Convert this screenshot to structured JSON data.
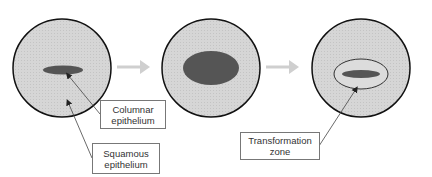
{
  "diagram": {
    "stages": [
      {
        "id": "stage-1",
        "description": "Squamous epithelium surrounding small columnar epithelium"
      },
      {
        "id": "stage-2",
        "description": "Enlarged columnar epithelium (ectropion)"
      },
      {
        "id": "stage-3",
        "description": "Columnar epithelium with surrounding transformation zone"
      }
    ],
    "labels": {
      "columnar": {
        "line1": "Columnar",
        "line2": "epithelium"
      },
      "squamous": {
        "line1": "Squamous",
        "line2": "epithelium"
      },
      "transformation": {
        "line1": "Transformation",
        "line2": "zone"
      }
    },
    "colors": {
      "squamous_fill": "#d4d4d4",
      "columnar_fill": "#5a5a5a",
      "outline": "#111111",
      "arrow": "#cccccc",
      "pointer": "#444444"
    }
  }
}
